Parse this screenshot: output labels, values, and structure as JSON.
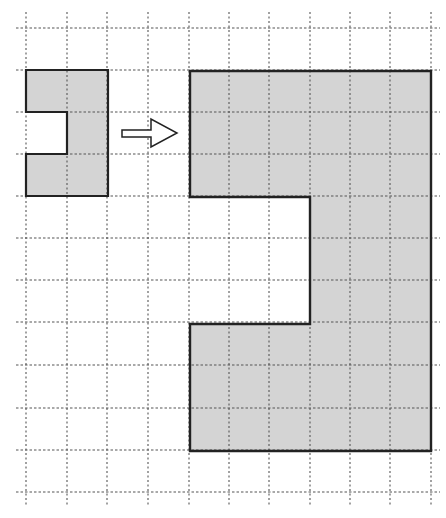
{
  "diagram": {
    "title": "",
    "colors": {
      "background": "#ffffff",
      "grid_line": "#555555",
      "shape_fill": "#d4d4d4",
      "shape_stroke": "#222222",
      "arrow_stroke": "#222222"
    },
    "grid": {
      "x_lines": [
        26,
        67,
        107,
        148,
        189,
        229,
        269,
        310,
        350,
        390,
        431
      ],
      "y_lines": [
        28,
        70,
        112,
        154,
        196,
        238,
        280,
        322,
        365,
        408,
        450,
        492
      ],
      "x_extent": [
        16,
        440
      ],
      "y_extent": [
        12,
        505
      ],
      "style": "dashed"
    },
    "original_shape": {
      "label": "small C-shape",
      "grid_units": "2 wide x 3 tall, notch 1x1 on left middle",
      "points": [
        [
          26,
          70
        ],
        [
          108,
          70
        ],
        [
          108,
          196
        ],
        [
          26,
          196
        ],
        [
          26,
          154
        ],
        [
          67,
          154
        ],
        [
          67,
          112
        ],
        [
          26,
          112
        ]
      ]
    },
    "arrow": {
      "direction": "right",
      "icon": "arrow-right-outline"
    },
    "scaled_shape": {
      "label": "large C-shape (scale factor 3)",
      "grid_units": "6 wide x 9 tall, notch 3x3 on left middle",
      "points": [
        [
          190,
          71
        ],
        [
          431,
          71
        ],
        [
          431,
          451
        ],
        [
          190,
          451
        ],
        [
          190,
          324
        ],
        [
          310,
          324
        ],
        [
          310,
          197
        ],
        [
          190,
          197
        ]
      ]
    }
  }
}
